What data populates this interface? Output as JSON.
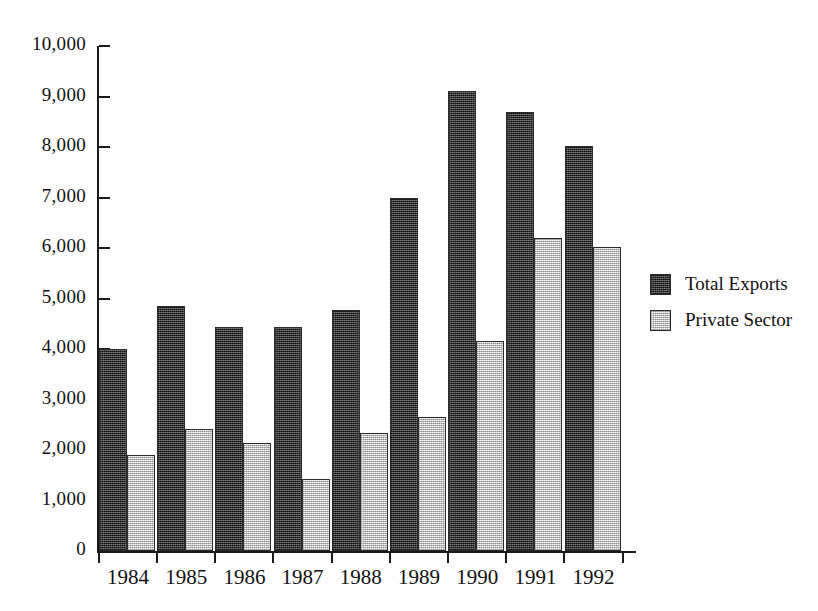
{
  "chart_data": {
    "type": "bar",
    "title": "",
    "xlabel": "",
    "ylabel": "",
    "categories": [
      "1984",
      "1985",
      "1986",
      "1987",
      "1988",
      "1989",
      "1990",
      "1991",
      "1992"
    ],
    "series": [
      {
        "name": "Total Exports",
        "color": "#4d4d4d",
        "values": [
          4000,
          4850,
          4430,
          4430,
          4780,
          7000,
          9100,
          8700,
          8030
        ]
      },
      {
        "name": "Private Sector",
        "color": "#d4d4d4",
        "values": [
          1900,
          2420,
          2130,
          1420,
          2330,
          2650,
          4150,
          6200,
          6030
        ]
      }
    ],
    "ylim": [
      0,
      10000
    ],
    "ytick_values": [
      0,
      1000,
      2000,
      3000,
      4000,
      5000,
      6000,
      7000,
      8000,
      9000,
      10000
    ],
    "ytick_labels": [
      "0",
      "1,000",
      "2,000",
      "3,000",
      "4,000",
      "5,000",
      "6,000",
      "7,000",
      "8,000",
      "9,000",
      "10,000"
    ],
    "grid": false,
    "legend_position": "right"
  },
  "legend": {
    "entries": [
      {
        "label": "Total Exports"
      },
      {
        "label": "Private Sector"
      }
    ]
  }
}
